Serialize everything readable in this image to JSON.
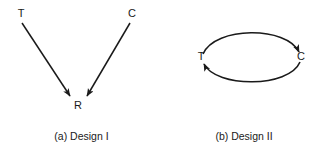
{
  "figure": {
    "background_color": "#ffffff",
    "stroke_color": "#1a1a1a",
    "text_color": "#1a1a1a"
  },
  "panels": [
    {
      "id": "design-1",
      "caption": "(a) Design I",
      "nodes": [
        {
          "id": "t",
          "label": "T",
          "x": 20,
          "y": 14
        },
        {
          "id": "c",
          "label": "C",
          "x": 131,
          "y": 14
        },
        {
          "id": "r",
          "label": "R",
          "x": 78,
          "y": 105
        }
      ],
      "edges": [
        {
          "from": "T",
          "to": "R",
          "shape": "straight",
          "arrowhead": "R"
        },
        {
          "from": "C",
          "to": "R",
          "shape": "straight",
          "arrowhead": "R"
        }
      ]
    },
    {
      "id": "design-2",
      "caption": "(b) Design II",
      "nodes": [
        {
          "id": "t",
          "label": "T",
          "x": 38,
          "y": 57
        },
        {
          "id": "c",
          "label": "C",
          "x": 138,
          "y": 57
        }
      ],
      "edges": [
        {
          "from": "T",
          "to": "C",
          "shape": "arc-top",
          "arrowhead": "C"
        },
        {
          "from": "C",
          "to": "T",
          "shape": "arc-bottom",
          "arrowhead": "T"
        }
      ]
    }
  ]
}
